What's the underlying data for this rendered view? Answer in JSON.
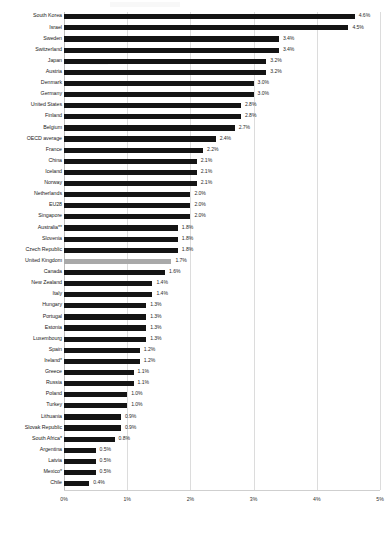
{
  "chart_data": {
    "type": "bar",
    "orientation": "horizontal",
    "title": "",
    "subtitle": "",
    "xlabel": "",
    "ylabel": "",
    "xlim": [
      0,
      5
    ],
    "grid": true,
    "legend": "none",
    "value_suffix": "%",
    "highlight_category": "United Kingdom",
    "highlight_color": "#a9a9a9",
    "bar_color": "#141414",
    "xticks": [
      "0%",
      "1%",
      "2%",
      "3%",
      "4%",
      "5%"
    ],
    "xtick_values": [
      0,
      1,
      2,
      3,
      4,
      5
    ],
    "categories": [
      "South Korea",
      "Israel",
      "Sweden",
      "Switzerland",
      "Japan",
      "Austria",
      "Denmark",
      "Germany",
      "United States",
      "Finland",
      "Belgium",
      "OECD average",
      "France",
      "China",
      "Iceland",
      "Norway",
      "Netherlands",
      "EU28",
      "Singapore",
      "Australia**",
      "Slovenia",
      "Czech Republic",
      "United Kingdom",
      "Canada",
      "New Zealand",
      "Italy",
      "Hungary",
      "Portugal",
      "Estonia",
      "Luxembourg",
      "Spain",
      "Ireland*",
      "Greece",
      "Russia",
      "Poland",
      "Turkey",
      "Lithuania",
      "Slovak Republic",
      "South Africa*",
      "Argentina",
      "Latvia",
      "Mexico*",
      "Chile"
    ],
    "values": [
      4.6,
      4.5,
      3.4,
      3.4,
      3.2,
      3.2,
      3.0,
      3.0,
      2.8,
      2.8,
      2.7,
      2.4,
      2.2,
      2.1,
      2.1,
      2.1,
      2.0,
      2.0,
      2.0,
      1.8,
      1.8,
      1.8,
      1.7,
      1.6,
      1.4,
      1.4,
      1.3,
      1.3,
      1.3,
      1.3,
      1.2,
      1.2,
      1.1,
      1.1,
      1.0,
      1.0,
      0.9,
      0.9,
      0.8,
      0.5,
      0.5,
      0.5,
      0.4
    ],
    "data_labels": [
      "4.6%",
      "4.5%",
      "3.4%",
      "3.4%",
      "3.2%",
      "3.2%",
      "3.0%",
      "3.0%",
      "2.8%",
      "2.8%",
      "2.7%",
      "2.4%",
      "2.2%",
      "2.1%",
      "2.1%",
      "2.1%",
      "2.0%",
      "2.0%",
      "2.0%",
      "1.8%",
      "1.8%",
      "1.8%",
      "1.7%",
      "1.6%",
      "1.4%",
      "1.4%",
      "1.3%",
      "1.3%",
      "1.3%",
      "1.3%",
      "1.2%",
      "1.2%",
      "1.1%",
      "1.1%",
      "1.0%",
      "1.0%",
      "0.9%",
      "0.9%",
      "0.8%",
      "0.5%",
      "0.5%",
      "0.5%",
      "0.4%"
    ]
  }
}
